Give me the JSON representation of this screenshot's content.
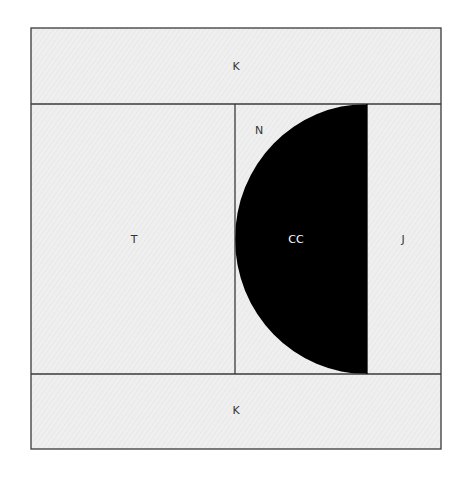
{
  "diagram": {
    "type": "quilt-block-template",
    "colors": {
      "background_fabric": "#ececec",
      "outline": "#3a3a3a",
      "dark_piece": "#000000"
    },
    "pieces": [
      {
        "id": "top",
        "label": "K"
      },
      {
        "id": "left",
        "label": "T"
      },
      {
        "id": "middle-top",
        "label": "N"
      },
      {
        "id": "half-circle",
        "label": "CC"
      },
      {
        "id": "right",
        "label": "J"
      },
      {
        "id": "bottom",
        "label": "K"
      }
    ]
  }
}
